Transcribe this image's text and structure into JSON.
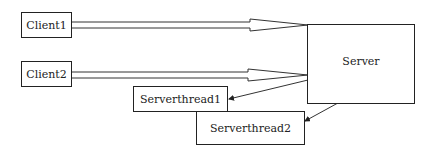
{
  "diagram": {
    "nodes": {
      "client1": {
        "label": "Client1"
      },
      "client2": {
        "label": "Client2"
      },
      "server": {
        "label": "Server"
      },
      "serverthread1": {
        "label": "Serverthread1"
      },
      "serverthread2": {
        "label": "Serverthread2"
      }
    },
    "edges": [
      {
        "from": "Client1",
        "to": "Server",
        "style": "hollow-double-arrow"
      },
      {
        "from": "Client2",
        "to": "Server",
        "style": "hollow-double-arrow"
      },
      {
        "from": "Server",
        "to": "Serverthread1",
        "style": "thin-arrow"
      },
      {
        "from": "Server",
        "to": "Serverthread2",
        "style": "thin-arrow"
      }
    ],
    "colors": {
      "stroke": "#222222",
      "background": "#ffffff"
    }
  }
}
